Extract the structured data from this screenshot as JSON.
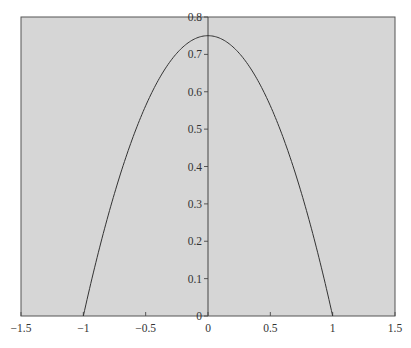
{
  "chart_data": {
    "type": "line",
    "title": "",
    "xlabel": "",
    "ylabel": "",
    "xlim": [
      -1.5,
      1.5
    ],
    "ylim": [
      0,
      0.8
    ],
    "grid": false,
    "legend": null,
    "x_ticks": [
      -1.5,
      -1,
      -0.5,
      0,
      0.5,
      1,
      1.5
    ],
    "x_tick_labels": [
      "−1.5",
      "−1",
      "−0.5",
      "0",
      "0.5",
      "1",
      "1.5"
    ],
    "y_ticks": [
      0,
      0.1,
      0.2,
      0.3,
      0.4,
      0.5,
      0.6,
      0.7,
      0.8
    ],
    "y_tick_labels": [
      "0",
      "0.1",
      "0.2",
      "0.3",
      "0.4",
      "0.5",
      "0.6",
      "0.7",
      "0.8"
    ],
    "series": [
      {
        "name": "f(x) = 0.75(1 - x^2)",
        "color": "#333333",
        "x": [
          -1,
          -0.9,
          -0.8,
          -0.7,
          -0.6,
          -0.5,
          -0.4,
          -0.3,
          -0.2,
          -0.1,
          0,
          0.1,
          0.2,
          0.3,
          0.4,
          0.5,
          0.6,
          0.7,
          0.8,
          0.9,
          1
        ],
        "y": [
          0,
          0.1425,
          0.27,
          0.3825,
          0.48,
          0.5625,
          0.63,
          0.6825,
          0.72,
          0.7425,
          0.75,
          0.7425,
          0.72,
          0.6825,
          0.63,
          0.5625,
          0.48,
          0.3825,
          0.27,
          0.1425,
          0
        ]
      }
    ],
    "annotations": [
      "vertical axis line at x = 0"
    ],
    "colors": {
      "plot_background": "#d6d6d6",
      "frame": "#555555",
      "curve": "#333333"
    }
  }
}
